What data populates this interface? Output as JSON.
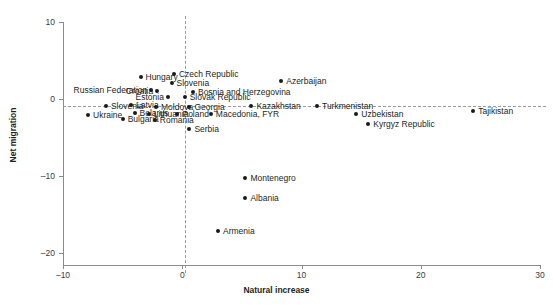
{
  "top_cropped_text": " ",
  "chart_data": {
    "type": "scatter",
    "title": "",
    "xlabel": "Natural increase",
    "ylabel": "Net migration",
    "xlim": [
      -10,
      30
    ],
    "ylim": [
      -20,
      10
    ],
    "xticks": [
      -10,
      0,
      10,
      20,
      30
    ],
    "xticklabels": [
      "–10",
      "0",
      "10",
      "20",
      "30"
    ],
    "yticks": [
      10,
      0,
      -10,
      -20
    ],
    "yticklabels": [
      "10",
      "0",
      "–10",
      "–20"
    ],
    "grid": false,
    "legend": "none",
    "reference_lines": [
      {
        "axis": "y",
        "value": 0,
        "style": "dashed"
      },
      {
        "axis": "x",
        "value": 0,
        "style": "dashed"
      }
    ],
    "points": [
      {
        "name": "Russian Federation",
        "x": -2.6,
        "y": 1.2,
        "label_side": "left"
      },
      {
        "name": "Hungary",
        "x": -3.5,
        "y": 2.9,
        "label_side": "right"
      },
      {
        "name": "Czech Republic",
        "x": -0.7,
        "y": 3.2,
        "label_side": "right"
      },
      {
        "name": "Croatia",
        "x": -2.1,
        "y": 1.1,
        "label_side": "left"
      },
      {
        "name": "Slovenia",
        "x": -0.9,
        "y": 2.1,
        "label_side": "right"
      },
      {
        "name": "Estonia",
        "x": -1.2,
        "y": 0.3,
        "label_side": "left"
      },
      {
        "name": "Bosnia and Herzegovina",
        "x": 0.9,
        "y": 0.9,
        "label_side": "right"
      },
      {
        "name": "Slovak Republic",
        "x": 0.2,
        "y": 0.2,
        "label_side": "right"
      },
      {
        "name": "Slovenia2",
        "x": -6.4,
        "y": -0.9,
        "label_side": "right",
        "display": "Slovenia"
      },
      {
        "name": "Latvia",
        "x": -4.3,
        "y": -0.8,
        "label_side": "right"
      },
      {
        "name": "Moldova",
        "x": -2.2,
        "y": -1.0,
        "label_side": "right"
      },
      {
        "name": "Georgia",
        "x": 0.6,
        "y": -1.0,
        "label_side": "right"
      },
      {
        "name": "Belarus",
        "x": -4.0,
        "y": -1.8,
        "label_side": "right"
      },
      {
        "name": "Lithuania",
        "x": -2.8,
        "y": -1.9,
        "label_side": "right"
      },
      {
        "name": "Poland",
        "x": -0.4,
        "y": -2.0,
        "label_side": "right"
      },
      {
        "name": "Macedonia, FYR",
        "x": 2.4,
        "y": -1.9,
        "label_side": "right"
      },
      {
        "name": "Ukraine",
        "x": -7.9,
        "y": -2.1,
        "label_side": "right"
      },
      {
        "name": "Bulgaria",
        "x": -5.0,
        "y": -2.6,
        "label_side": "right"
      },
      {
        "name": "Romania",
        "x": -2.3,
        "y": -2.7,
        "label_side": "right"
      },
      {
        "name": "Serbia",
        "x": 0.6,
        "y": -3.9,
        "label_side": "right"
      },
      {
        "name": "Azerbaijan",
        "x": 8.3,
        "y": 2.3,
        "label_side": "right"
      },
      {
        "name": "Kazakhstan",
        "x": 5.8,
        "y": -0.9,
        "label_side": "right"
      },
      {
        "name": "Turkmenistan",
        "x": 11.3,
        "y": -0.9,
        "label_side": "right"
      },
      {
        "name": "Uzbekistan",
        "x": 14.6,
        "y": -1.9,
        "label_side": "right"
      },
      {
        "name": "Kyrgyz Republic",
        "x": 15.6,
        "y": -3.2,
        "label_side": "right"
      },
      {
        "name": "Tajikistan",
        "x": 24.4,
        "y": -1.6,
        "label_side": "right"
      },
      {
        "name": "Montenegro",
        "x": 5.3,
        "y": -10.3,
        "label_side": "right"
      },
      {
        "name": "Albania",
        "x": 5.3,
        "y": -12.8,
        "label_side": "right"
      },
      {
        "name": "Armenia",
        "x": 3.0,
        "y": -17.1,
        "label_side": "right"
      }
    ]
  }
}
